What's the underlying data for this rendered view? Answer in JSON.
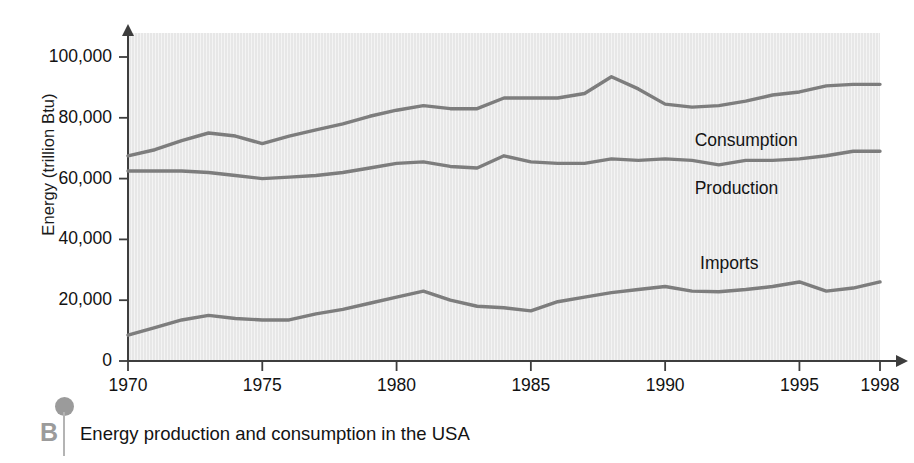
{
  "figure": {
    "caption_letter": "B",
    "caption_text": "Energy production and consumption in the USA",
    "y_axis_title": "Energy (trillion Btu)",
    "line_color": "#7d7d7d",
    "plot_bg_color": "#e7e7e7",
    "axis_color": "#3d3d3d",
    "text_color": "#131313",
    "accent_color": "#9b9b9b"
  },
  "chart_data": {
    "type": "line",
    "title": "Energy production and consumption in the USA",
    "xlabel": "",
    "ylabel": "Energy (trillion Btu)",
    "xlim": [
      1970,
      1998
    ],
    "ylim": [
      0,
      105000
    ],
    "grid": false,
    "legend": "inline-labels",
    "x_tick_labels": [
      "1970",
      "1975",
      "1980",
      "1985",
      "1990",
      "1995",
      "1998"
    ],
    "x_ticks": [
      1970,
      1975,
      1980,
      1985,
      1990,
      1995,
      1998
    ],
    "y_tick_labels": [
      "0",
      "20,000",
      "40,000",
      "60,000",
      "80,000",
      "100,000"
    ],
    "y_ticks": [
      0,
      20000,
      40000,
      60000,
      80000,
      100000
    ],
    "x": [
      1970,
      1971,
      1972,
      1973,
      1974,
      1975,
      1976,
      1977,
      1978,
      1979,
      1980,
      1981,
      1982,
      1983,
      1984,
      1985,
      1986,
      1987,
      1988,
      1989,
      1990,
      1991,
      1992,
      1993,
      1994,
      1995,
      1996,
      1997,
      1998
    ],
    "series": [
      {
        "name": "Consumption",
        "label": "Consumption",
        "label_x": 1991.1,
        "label_y": 72500,
        "values": [
          67500,
          69500,
          72500,
          75000,
          74000,
          71500,
          74000,
          76000,
          78000,
          80500,
          82500,
          84000,
          83000,
          83000,
          86500,
          86500,
          86500,
          88000,
          93500,
          89500,
          84500,
          83500,
          84000,
          85500,
          87500,
          88500,
          90500,
          91000,
          91000
        ]
      },
      {
        "name": "Production",
        "label": "Production",
        "label_x": 1991.1,
        "label_y": 56500,
        "values": [
          62500,
          62500,
          62500,
          62000,
          61000,
          60000,
          60500,
          61000,
          62000,
          63500,
          65000,
          65500,
          64000,
          63500,
          67500,
          65500,
          65000,
          65000,
          66500,
          66000,
          66500,
          66000,
          64500,
          66000,
          66000,
          66500,
          67500,
          69000,
          69000
        ]
      },
      {
        "name": "Imports",
        "label": "Imports",
        "label_x": 1991.3,
        "label_y": 32000,
        "values": [
          8500,
          11000,
          13500,
          15000,
          14000,
          13500,
          13500,
          15500,
          17000,
          19000,
          21000,
          23000,
          20000,
          18000,
          17500,
          16500,
          19500,
          21000,
          22500,
          23500,
          24500,
          23000,
          22800,
          23500,
          24500,
          26000,
          23000,
          24000,
          26000
        ]
      }
    ]
  }
}
